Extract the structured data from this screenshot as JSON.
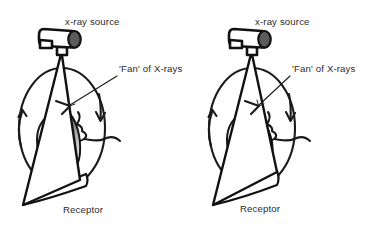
{
  "figure": {
    "background_color": "#ffffff",
    "line_color": "#1a1a1a",
    "tube_fill": "#ffffff",
    "tube_cap_color": "#5b5b5b",
    "jaw_gradient_dark": "#3a3a3a",
    "jaw_gradient_light": "#f2f2f2",
    "text_color": "#2b2b2b"
  },
  "panels": [
    {
      "id": "left-panel",
      "name": "start-position",
      "labels": {
        "source": "x-ray source",
        "fan": "'Fan' of X-rays",
        "receptor": "Receptor"
      }
    },
    {
      "id": "right-panel",
      "name": "rotated-position",
      "labels": {
        "source": "x-ray source",
        "fan": "'Fan' of X-rays",
        "receptor": "Receptor"
      }
    }
  ],
  "icons": {
    "xray_tube": "xray-tube-icon",
    "rotation_arrow_left": "rotation-arrow-up-icon",
    "rotation_arrow_right": "rotation-arrow-down-icon",
    "fan_beam": "fan-beam-icon",
    "receptor": "receptor-icon",
    "head_profile": "head-profile-icon",
    "mandible": "mandible-icon"
  }
}
